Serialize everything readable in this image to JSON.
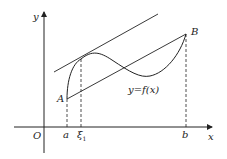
{
  "diagram": {
    "labels": {
      "y_axis": "y",
      "x_axis": "x",
      "origin": "O",
      "point_a": "A",
      "point_b": "B",
      "a": "a",
      "b": "b",
      "xi": "ξ",
      "xi_sub": "1",
      "curve": "y=f(x)"
    },
    "colors": {
      "stroke": "#222222"
    }
  }
}
